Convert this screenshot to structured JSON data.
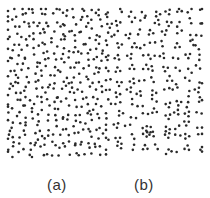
{
  "figure": {
    "background": "#ffffff",
    "dot_color": "#2a2a2a",
    "dot_radius": 1.3
  },
  "panels": [
    {
      "id": "a",
      "label": "(a)",
      "pattern": "random-uniform",
      "region": {
        "x0": 8,
        "y0": 9,
        "x1": 103,
        "y1": 157
      },
      "grid_step": 6.6,
      "jitter": 3.2,
      "seed": 17
    },
    {
      "id": "b",
      "label": "(b)",
      "pattern": "clustered-pairs-triplets",
      "region": {
        "x0": 106,
        "y0": 9,
        "x1": 202,
        "y1": 157
      },
      "cluster_step": 11.5,
      "jitter": 3.6,
      "cluster_spread": 2.6,
      "seed": 41
    }
  ]
}
